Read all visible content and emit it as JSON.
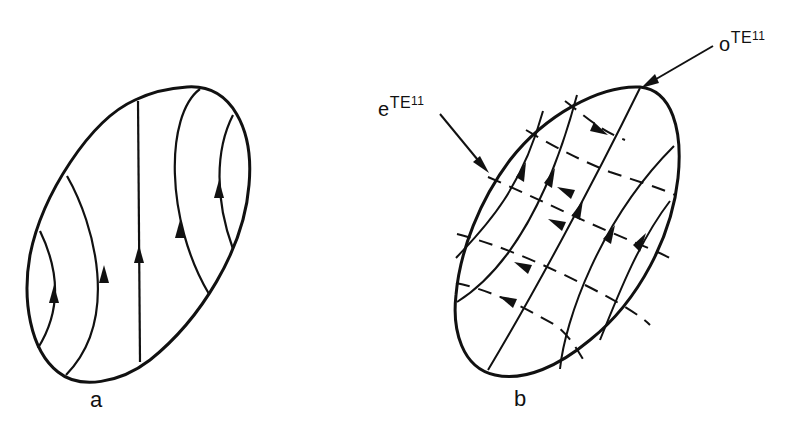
{
  "figure": {
    "panels": [
      {
        "id": "a",
        "label": "a",
        "description": "Elliptical cross-section with solid field lines curving upward, arrows pointing up"
      },
      {
        "id": "b",
        "label": "b",
        "description": "Elliptical cross-section with two superposed families of field lines: solid (arrows up-right) and dashed (arrows up-left)",
        "annotations": [
          {
            "prefix": "e",
            "mode": "TE",
            "subscript": "11",
            "points_to": "left edge of ellipse"
          },
          {
            "prefix": "o",
            "mode": "TE",
            "subscript": "11",
            "points_to": "top of ellipse"
          }
        ]
      }
    ],
    "colors": {
      "ink": "#111111",
      "background": "#ffffff"
    }
  }
}
